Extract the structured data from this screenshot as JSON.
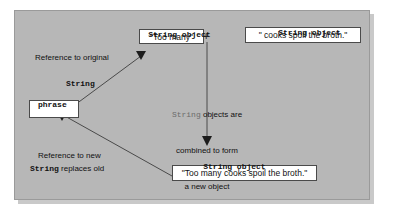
{
  "figure": {
    "panel_color": "#b7b7b7",
    "box_fill": "#ffffff",
    "line_color": "#4a4a4a"
  },
  "labels": {
    "top_left_caption": "String object",
    "top_right_caption": "String object",
    "bottom_caption": "String object",
    "plus_operator": "+",
    "ref_original_line": "Reference to original",
    "ref_original_type": "String",
    "variable_name": "phrase",
    "ref_new_line1": "Reference to new",
    "ref_new_type": "String",
    "ref_new_line2": " replaces old",
    "center_note_mono": "String",
    "center_note_rest": " objects are",
    "center_note_line2": "combined to form",
    "center_note_line3": "a new object"
  },
  "boxes": {
    "first_string": "\"Too many\"",
    "second_string": "\" cooks spoil the broth.\"",
    "result_string": "\"Too many cooks spoil the broth.\"",
    "phrase_box_value": ""
  }
}
